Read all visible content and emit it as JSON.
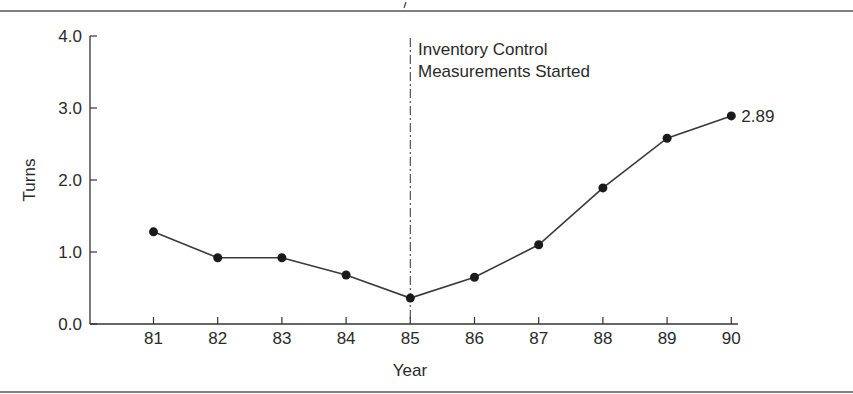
{
  "chart_data": {
    "type": "line",
    "title": "",
    "xlabel": "Year",
    "ylabel": "Turns",
    "categories": [
      "81",
      "82",
      "83",
      "84",
      "85",
      "86",
      "87",
      "88",
      "89",
      "90"
    ],
    "series": [
      {
        "name": "Inventory Turns",
        "values": [
          1.28,
          0.92,
          0.92,
          0.68,
          0.36,
          0.65,
          1.1,
          1.89,
          2.58,
          2.89
        ]
      }
    ],
    "ylim": [
      0.0,
      4.0
    ],
    "yticks": [
      "0.0",
      "1.0",
      "2.0",
      "3.0",
      "4.0"
    ],
    "grid": false,
    "legend": "none",
    "annotations": [
      {
        "type": "vertical-line",
        "style": "dash-dot",
        "x": "85",
        "text_line1": "Inventory Control",
        "text_line2": "Measurements Started"
      },
      {
        "type": "data-label",
        "x": "90",
        "text": "2.89"
      }
    ]
  },
  "labels": {
    "xlabel": "Year",
    "ylabel": "Turns",
    "annotation_line1": "Inventory Control",
    "annotation_line2": "Measurements Started",
    "end_value_label": "2.89"
  },
  "colors": {
    "line": "#3a3a3a",
    "marker": "#1a1a1a",
    "text": "#2a2a2a",
    "rule": "#555555"
  }
}
